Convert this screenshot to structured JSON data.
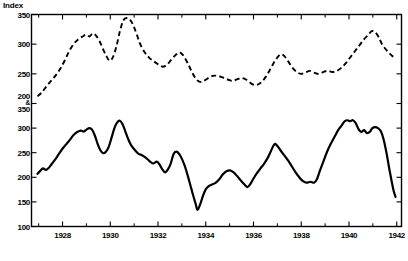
{
  "chart_data": {
    "type": "line",
    "title": "",
    "ylabel": "Index",
    "xlabel": "",
    "grid": false,
    "legend": null,
    "xlim": [
      1926.7,
      1942.2
    ],
    "x_ticks_major": [
      1928,
      1930,
      1932,
      1934,
      1936,
      1938,
      1940,
      1942
    ],
    "x_tick_labels": [
      "1928",
      "1930",
      "1932",
      "1934",
      "1936",
      "1938",
      "1940",
      "1942"
    ],
    "x_ticks_minor": [
      1927,
      1929,
      1931,
      1933,
      1935,
      1937,
      1939,
      1941
    ],
    "y_axis_upper": {
      "label": "Index",
      "lim": [
        200,
        350
      ],
      "ticks": [
        200,
        250,
        300,
        350
      ],
      "tick_labels": [
        "200",
        "250",
        "300",
        "350"
      ]
    },
    "y_axis_lower": {
      "lim": [
        100,
        350
      ],
      "ticks": [
        100,
        150,
        200,
        250,
        300,
        350
      ],
      "tick_labels": [
        "100",
        "150",
        "200",
        "250",
        "300",
        "350"
      ]
    },
    "y_tick_render": [
      {
        "label": "350",
        "scale": "upper",
        "value": 350
      },
      {
        "label": "300",
        "scale": "upper",
        "value": 300
      },
      {
        "label": "250",
        "scale": "upper",
        "value": 250
      },
      {
        "label": "200 & 350",
        "scale": "shared",
        "value_upper": 200,
        "value_lower": 350
      },
      {
        "label": "300",
        "scale": "lower",
        "value": 300
      },
      {
        "label": "250",
        "scale": "lower",
        "value": 250
      },
      {
        "label": "200",
        "scale": "lower",
        "value": 200
      },
      {
        "label": "150",
        "scale": "lower",
        "value": 150
      },
      {
        "label": "100",
        "scale": "lower",
        "value": 100
      }
    ],
    "shared_tick_label_top": "200",
    "shared_tick_label_amp": "&",
    "shared_tick_label_bottom": "350",
    "series": [
      {
        "name": "dashed-series",
        "style": "dashed",
        "axis": "upper",
        "color": "#000000",
        "points": [
          [
            1926.95,
            212
          ],
          [
            1927.15,
            219
          ],
          [
            1927.35,
            229
          ],
          [
            1927.55,
            238
          ],
          [
            1927.75,
            247
          ],
          [
            1927.95,
            258
          ],
          [
            1928.15,
            272
          ],
          [
            1928.35,
            288
          ],
          [
            1928.55,
            300
          ],
          [
            1928.75,
            308
          ],
          [
            1928.95,
            313
          ],
          [
            1929.1,
            316
          ],
          [
            1929.25,
            313
          ],
          [
            1929.4,
            318
          ],
          [
            1929.55,
            314
          ],
          [
            1929.7,
            305
          ],
          [
            1929.85,
            292
          ],
          [
            1930.0,
            280
          ],
          [
            1930.15,
            272
          ],
          [
            1930.3,
            279
          ],
          [
            1930.45,
            297
          ],
          [
            1930.6,
            322
          ],
          [
            1930.75,
            340
          ],
          [
            1930.9,
            344
          ],
          [
            1931.05,
            341
          ],
          [
            1931.2,
            331
          ],
          [
            1931.35,
            316
          ],
          [
            1931.5,
            300
          ],
          [
            1931.7,
            286
          ],
          [
            1931.9,
            277
          ],
          [
            1932.1,
            271
          ],
          [
            1932.3,
            266
          ],
          [
            1932.5,
            262
          ],
          [
            1932.7,
            266
          ],
          [
            1932.9,
            275
          ],
          [
            1933.1,
            283
          ],
          [
            1933.25,
            286
          ],
          [
            1933.4,
            281
          ],
          [
            1933.6,
            268
          ],
          [
            1933.8,
            252
          ],
          [
            1934.0,
            240
          ],
          [
            1934.2,
            236
          ],
          [
            1934.4,
            240
          ],
          [
            1934.6,
            245
          ],
          [
            1934.8,
            247
          ],
          [
            1935.0,
            246
          ],
          [
            1935.2,
            243
          ],
          [
            1935.4,
            240
          ],
          [
            1935.6,
            238
          ],
          [
            1935.8,
            241
          ],
          [
            1936.0,
            243
          ],
          [
            1936.2,
            240
          ],
          [
            1936.4,
            234
          ],
          [
            1936.6,
            231
          ],
          [
            1936.8,
            234
          ],
          [
            1937.0,
            242
          ],
          [
            1937.2,
            254
          ],
          [
            1937.4,
            268
          ],
          [
            1937.6,
            279
          ],
          [
            1937.75,
            283
          ],
          [
            1937.9,
            279
          ],
          [
            1938.05,
            271
          ],
          [
            1938.2,
            262
          ],
          [
            1938.4,
            254
          ],
          [
            1938.6,
            250
          ],
          [
            1938.8,
            252
          ],
          [
            1939.0,
            255
          ],
          [
            1939.2,
            252
          ],
          [
            1939.4,
            250
          ],
          [
            1939.6,
            253
          ],
          [
            1939.8,
            255
          ],
          [
            1940.0,
            253
          ],
          [
            1940.2,
            255
          ],
          [
            1940.4,
            260
          ],
          [
            1940.6,
            268
          ],
          [
            1940.8,
            278
          ],
          [
            1941.0,
            288
          ],
          [
            1941.2,
            298
          ],
          [
            1941.4,
            308
          ],
          [
            1941.6,
            316
          ],
          [
            1941.75,
            322
          ],
          [
            1941.9,
            320
          ],
          [
            1942.05,
            312
          ],
          [
            1942.2,
            300
          ],
          [
            1942.4,
            290
          ],
          [
            1942.6,
            282
          ],
          [
            1942.8,
            276
          ]
        ]
      },
      {
        "name": "solid-series",
        "style": "solid",
        "axis": "lower",
        "color": "#000000",
        "points": [
          [
            1926.95,
            207
          ],
          [
            1927.1,
            213
          ],
          [
            1927.25,
            218
          ],
          [
            1927.4,
            215
          ],
          [
            1927.55,
            219
          ],
          [
            1927.7,
            226
          ],
          [
            1927.9,
            236
          ],
          [
            1928.1,
            247
          ],
          [
            1928.3,
            258
          ],
          [
            1928.5,
            267
          ],
          [
            1928.7,
            276
          ],
          [
            1928.9,
            286
          ],
          [
            1929.1,
            292
          ],
          [
            1929.3,
            295
          ],
          [
            1929.45,
            293
          ],
          [
            1929.6,
            297
          ],
          [
            1929.75,
            300
          ],
          [
            1929.9,
            297
          ],
          [
            1930.05,
            285
          ],
          [
            1930.2,
            268
          ],
          [
            1930.35,
            255
          ],
          [
            1930.5,
            249
          ],
          [
            1930.65,
            252
          ],
          [
            1930.8,
            262
          ],
          [
            1930.95,
            280
          ],
          [
            1931.1,
            299
          ],
          [
            1931.25,
            311
          ],
          [
            1931.4,
            315
          ],
          [
            1931.55,
            308
          ],
          [
            1931.7,
            293
          ],
          [
            1931.85,
            278
          ],
          [
            1932.0,
            266
          ],
          [
            1932.2,
            256
          ],
          [
            1932.4,
            248
          ],
          [
            1932.6,
            245
          ],
          [
            1932.8,
            240
          ],
          [
            1933.0,
            233
          ],
          [
            1933.2,
            228
          ],
          [
            1933.4,
            232
          ],
          [
            1933.55,
            226
          ],
          [
            1933.7,
            216
          ],
          [
            1933.85,
            210
          ],
          [
            1934.0,
            216
          ],
          [
            1934.15,
            228
          ],
          [
            1934.3,
            247
          ],
          [
            1934.45,
            252
          ],
          [
            1934.6,
            248
          ],
          [
            1934.75,
            238
          ],
          [
            1934.9,
            224
          ],
          [
            1935.05,
            206
          ],
          [
            1935.2,
            186
          ],
          [
            1935.35,
            165
          ],
          [
            1935.5,
            146
          ],
          [
            1935.6,
            134
          ],
          [
            1935.75,
            146
          ],
          [
            1935.9,
            163
          ],
          [
            1936.05,
            176
          ],
          [
            1936.2,
            182
          ],
          [
            1936.35,
            185
          ],
          [
            1936.55,
            188
          ],
          [
            1936.75,
            195
          ],
          [
            1936.95,
            205
          ],
          [
            1937.15,
            212
          ],
          [
            1937.35,
            214
          ],
          [
            1937.55,
            210
          ],
          [
            1937.75,
            202
          ],
          [
            1937.95,
            193
          ],
          [
            1938.15,
            185
          ],
          [
            1938.3,
            180
          ],
          [
            1938.45,
            186
          ],
          [
            1938.6,
            196
          ],
          [
            1938.8,
            208
          ],
          [
            1939.0,
            218
          ],
          [
            1939.2,
            228
          ],
          [
            1939.4,
            240
          ],
          [
            1939.55,
            252
          ],
          [
            1939.7,
            264
          ],
          [
            1939.8,
            268
          ],
          [
            1939.95,
            262
          ],
          [
            1940.1,
            254
          ],
          [
            1940.3,
            244
          ],
          [
            1940.5,
            234
          ],
          [
            1940.7,
            222
          ],
          [
            1940.9,
            210
          ],
          [
            1941.1,
            200
          ],
          [
            1941.3,
            192
          ],
          [
            1941.5,
            189
          ],
          [
            1941.7,
            191
          ],
          [
            1941.9,
            189
          ],
          [
            1942.05,
            196
          ],
          [
            1942.2,
            212
          ],
          [
            1942.4,
            232
          ],
          [
            1942.6,
            252
          ],
          [
            1942.8,
            268
          ],
          [
            1943.0,
            282
          ],
          [
            1943.2,
            296
          ],
          [
            1943.4,
            306
          ],
          [
            1943.55,
            314
          ],
          [
            1943.7,
            316
          ],
          [
            1943.85,
            314
          ],
          [
            1944.0,
            316
          ],
          [
            1944.15,
            310
          ],
          [
            1944.3,
            298
          ],
          [
            1944.45,
            292
          ],
          [
            1944.6,
            296
          ],
          [
            1944.75,
            290
          ],
          [
            1944.9,
            292
          ],
          [
            1945.05,
            300
          ],
          [
            1945.2,
            302
          ],
          [
            1945.35,
            300
          ],
          [
            1945.5,
            294
          ],
          [
            1945.65,
            278
          ],
          [
            1945.8,
            252
          ],
          [
            1945.95,
            220
          ],
          [
            1946.1,
            190
          ],
          [
            1946.2,
            172
          ],
          [
            1946.3,
            160
          ]
        ]
      }
    ]
  }
}
